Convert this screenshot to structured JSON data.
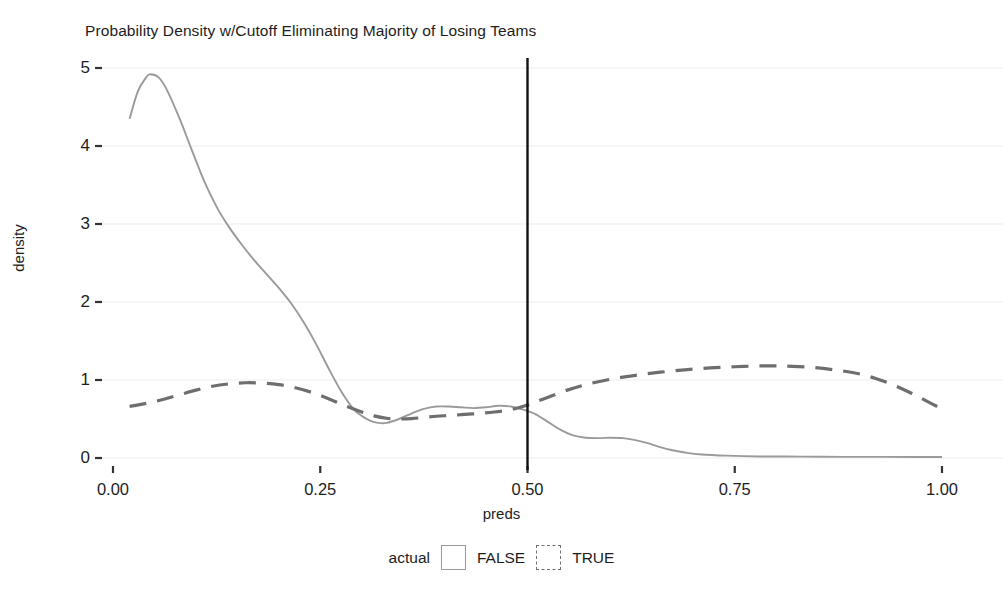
{
  "chart_data": {
    "type": "line",
    "title": "Probability Density w/Cutoff Eliminating Majority of Losing Teams",
    "xlabel": "preds",
    "ylabel": "density",
    "xlim": [
      0.0,
      1.0
    ],
    "ylim": [
      0.0,
      5.0
    ],
    "xticks": [
      "0.00",
      "0.25",
      "0.50",
      "0.75",
      "1.00"
    ],
    "xtick_values": [
      0.0,
      0.25,
      0.5,
      0.75,
      1.0
    ],
    "yticks": [
      "0",
      "1",
      "2",
      "3",
      "4",
      "5"
    ],
    "ytick_values": [
      0,
      1,
      2,
      3,
      4,
      5
    ],
    "grid": "horizontal-major-faint",
    "legend": {
      "position": "bottom",
      "title": "actual",
      "entries": [
        {
          "label": "FALSE",
          "linestyle": "solid",
          "color": "#9a9a9a",
          "key": "key-solid"
        },
        {
          "label": "TRUE",
          "linestyle": "dashed",
          "color": "#6e6e6e",
          "key": "key-dashed"
        }
      ]
    },
    "annotations": [
      {
        "name": "cutoff-line",
        "type": "vline",
        "x": 0.5,
        "color": "#111111",
        "width": 2.4
      }
    ],
    "series": [
      {
        "name": "FALSE",
        "linestyle": "solid",
        "color": "#9a9a9a",
        "x": [
          0.02,
          0.03,
          0.04,
          0.045,
          0.055,
          0.065,
          0.08,
          0.095,
          0.11,
          0.125,
          0.14,
          0.155,
          0.17,
          0.185,
          0.2,
          0.215,
          0.23,
          0.245,
          0.26,
          0.275,
          0.29,
          0.3,
          0.31,
          0.32,
          0.33,
          0.345,
          0.36,
          0.375,
          0.39,
          0.405,
          0.42,
          0.435,
          0.45,
          0.465,
          0.48,
          0.495,
          0.51,
          0.525,
          0.54,
          0.555,
          0.57,
          0.585,
          0.6,
          0.615,
          0.63,
          0.645,
          0.66,
          0.675,
          0.69,
          0.71,
          0.74,
          0.78,
          0.83,
          0.88,
          0.93,
          0.97,
          1.0
        ],
        "y": [
          4.35,
          4.7,
          4.88,
          4.92,
          4.88,
          4.72,
          4.36,
          3.95,
          3.55,
          3.22,
          2.96,
          2.74,
          2.54,
          2.36,
          2.18,
          1.98,
          1.74,
          1.46,
          1.15,
          0.86,
          0.63,
          0.54,
          0.48,
          0.45,
          0.45,
          0.5,
          0.57,
          0.63,
          0.66,
          0.66,
          0.65,
          0.64,
          0.65,
          0.67,
          0.66,
          0.62,
          0.56,
          0.46,
          0.36,
          0.29,
          0.26,
          0.255,
          0.26,
          0.255,
          0.23,
          0.19,
          0.14,
          0.1,
          0.07,
          0.045,
          0.03,
          0.02,
          0.018,
          0.015,
          0.014,
          0.013,
          0.012
        ]
      },
      {
        "name": "TRUE",
        "linestyle": "dashed",
        "color": "#6e6e6e",
        "x": [
          0.02,
          0.04,
          0.06,
          0.08,
          0.1,
          0.12,
          0.14,
          0.16,
          0.18,
          0.2,
          0.22,
          0.24,
          0.26,
          0.28,
          0.3,
          0.315,
          0.33,
          0.345,
          0.36,
          0.375,
          0.39,
          0.405,
          0.42,
          0.44,
          0.46,
          0.48,
          0.5,
          0.52,
          0.545,
          0.57,
          0.6,
          0.63,
          0.66,
          0.69,
          0.72,
          0.75,
          0.78,
          0.8,
          0.82,
          0.845,
          0.87,
          0.895,
          0.92,
          0.945,
          0.965,
          0.985,
          1.0
        ],
        "y": [
          0.66,
          0.7,
          0.75,
          0.81,
          0.87,
          0.92,
          0.95,
          0.965,
          0.96,
          0.94,
          0.9,
          0.84,
          0.76,
          0.67,
          0.59,
          0.54,
          0.51,
          0.5,
          0.505,
          0.52,
          0.535,
          0.545,
          0.555,
          0.57,
          0.59,
          0.62,
          0.68,
          0.76,
          0.86,
          0.94,
          1.01,
          1.06,
          1.1,
          1.13,
          1.155,
          1.17,
          1.18,
          1.18,
          1.175,
          1.16,
          1.13,
          1.09,
          1.02,
          0.92,
          0.82,
          0.71,
          0.63
        ]
      }
    ]
  }
}
